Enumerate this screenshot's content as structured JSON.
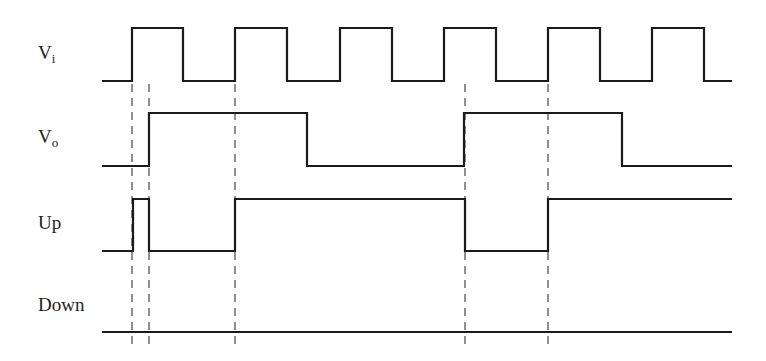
{
  "diagram": {
    "type": "timing-diagram",
    "signals": [
      {
        "id": "vi",
        "label_main": "V",
        "label_sub": "i",
        "label_pos": [
          38,
          42
        ],
        "high_y": 28,
        "low_y": 81,
        "start_x": 102,
        "end_x": 732,
        "initial": "low",
        "transitions_x": [
          132,
          183,
          235,
          287,
          340,
          392,
          444,
          496,
          548,
          600,
          652,
          704
        ]
      },
      {
        "id": "vo",
        "label_main": "V",
        "label_sub": "o",
        "label_pos": [
          38,
          126
        ],
        "high_y": 113,
        "low_y": 166,
        "start_x": 102,
        "end_x": 732,
        "initial": "low",
        "transitions_x": [
          149,
          307,
          464,
          622
        ]
      },
      {
        "id": "up",
        "label_main": "Up",
        "label_sub": "",
        "label_pos": [
          38,
          212
        ],
        "high_y": 199,
        "low_y": 251,
        "start_x": 102,
        "end_x": 732,
        "initial": "low",
        "transitions_x": [
          133,
          149,
          235,
          465,
          548
        ]
      },
      {
        "id": "down",
        "label_main": "Down",
        "label_sub": "",
        "label_pos": [
          38,
          294
        ],
        "high_y": 280,
        "low_y": 332,
        "start_x": 102,
        "end_x": 732,
        "initial": "low",
        "transitions_x": []
      }
    ],
    "guide_lines": {
      "x": [
        132,
        149,
        235,
        465,
        548
      ],
      "y_start": 84,
      "y_end": 350,
      "style": "dashed"
    },
    "colors": {
      "line": "#1a1a1a",
      "guide": "#333333",
      "text": "#222222",
      "background": "#ffffff"
    }
  }
}
